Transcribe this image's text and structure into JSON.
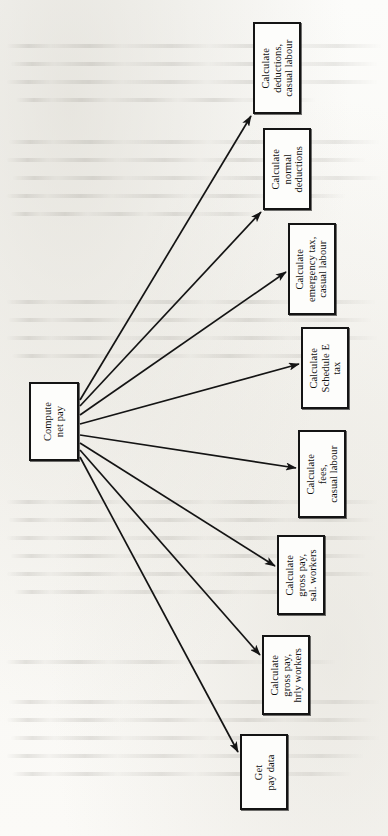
{
  "figure": {
    "caption": "Fig. 3.11 The structure chart",
    "orientation": "rotated-90-ccw",
    "ink_color": "#141414",
    "paper_color": "#fbfbf9"
  },
  "diagram": {
    "type": "structure-chart",
    "root": {
      "id": "compute-net-pay",
      "lines": [
        "Compute",
        "net pay"
      ],
      "x": 29,
      "y": 382,
      "w": 50,
      "h": 79
    },
    "nodes": [
      {
        "id": "calculate-deductions-casual-labour",
        "lines": [
          "Calculate",
          "deductions,",
          "casual labour"
        ],
        "x": 253,
        "y": 22,
        "w": 48,
        "h": 92
      },
      {
        "id": "calculate-normal-deductions",
        "lines": [
          "Calculate",
          "normal",
          "deductions"
        ],
        "x": 263,
        "y": 128,
        "w": 48,
        "h": 82
      },
      {
        "id": "calculate-emergency-tax-casual-labour",
        "lines": [
          "Calculate",
          "emergency tax,",
          "casual labour"
        ],
        "x": 288,
        "y": 223,
        "w": 48,
        "h": 92
      },
      {
        "id": "calculate-schedule-e-tax",
        "lines": [
          "Calculate",
          "Schedule E",
          "tax"
        ],
        "x": 301,
        "y": 327,
        "w": 48,
        "h": 82
      },
      {
        "id": "calculate-fees-casual-labour",
        "lines": [
          "Calculate",
          "fees,",
          "casual labour"
        ],
        "x": 298,
        "y": 430,
        "w": 48,
        "h": 88
      },
      {
        "id": "calculate-gross-pay-sal-workers",
        "lines": [
          "Calculate",
          "gross pay,",
          "sal. workers"
        ],
        "x": 277,
        "y": 535,
        "w": 48,
        "h": 80
      },
      {
        "id": "calculate-gross-pay-hrly-workers",
        "lines": [
          "Calculate",
          "gross pay,",
          "hrly workers"
        ],
        "x": 262,
        "y": 635,
        "w": 48,
        "h": 80
      },
      {
        "id": "get-pay-data",
        "lines": [
          "Get",
          "pay data"
        ],
        "x": 240,
        "y": 734,
        "w": 48,
        "h": 76
      }
    ],
    "arrows": [
      {
        "from": "compute-net-pay",
        "to": "calculate-deductions-casual-labour",
        "x1": 80,
        "y1": 400,
        "x2": 251,
        "y2": 116
      },
      {
        "from": "compute-net-pay",
        "to": "calculate-normal-deductions",
        "x1": 80,
        "y1": 406,
        "x2": 261,
        "y2": 212
      },
      {
        "from": "compute-net-pay",
        "to": "calculate-emergency-tax-casual-labour",
        "x1": 80,
        "y1": 415,
        "x2": 286,
        "y2": 272
      },
      {
        "from": "compute-net-pay",
        "to": "calculate-schedule-e-tax",
        "x1": 80,
        "y1": 424,
        "x2": 299,
        "y2": 364
      },
      {
        "from": "compute-net-pay",
        "to": "calculate-fees-casual-labour",
        "x1": 80,
        "y1": 435,
        "x2": 296,
        "y2": 468
      },
      {
        "from": "compute-net-pay",
        "to": "calculate-gross-pay-sal-workers",
        "x1": 80,
        "y1": 443,
        "x2": 275,
        "y2": 566
      },
      {
        "from": "compute-net-pay",
        "to": "calculate-gross-pay-hrly-workers",
        "x1": 80,
        "y1": 450,
        "x2": 260,
        "y2": 655
      },
      {
        "from": "compute-net-pay",
        "to": "get-pay-data",
        "x1": 80,
        "y1": 457,
        "x2": 238,
        "y2": 752
      }
    ]
  }
}
